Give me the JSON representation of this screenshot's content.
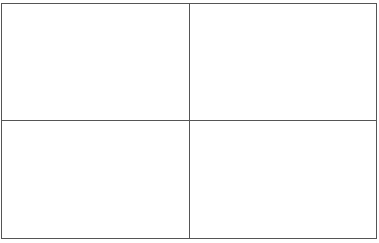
{
  "grid": {
    "rows": 2,
    "columns": 2,
    "line_color": "#555555",
    "cells": [
      {
        "row": 0,
        "col": 0,
        "text": ""
      },
      {
        "row": 0,
        "col": 1,
        "text": ""
      },
      {
        "row": 1,
        "col": 0,
        "text": ""
      },
      {
        "row": 1,
        "col": 1,
        "text": ""
      }
    ]
  }
}
